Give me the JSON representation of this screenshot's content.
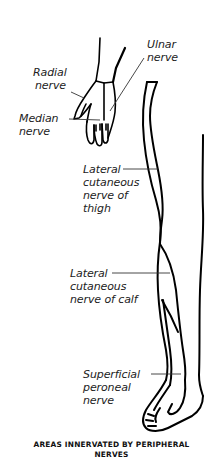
{
  "figure": {
    "title_line1": "AREAS INNERVATED BY PERIPHERAL",
    "title_line2": "NERVES",
    "labels": {
      "radial": {
        "line1": "Radial",
        "line2": "nerve"
      },
      "ulnar": {
        "line1": "Ulnar",
        "line2": "nerve"
      },
      "median": {
        "line1": "Median",
        "line2": "nerve"
      },
      "lateral_thigh": {
        "line1": "Lateral",
        "line2": "cutaneous",
        "line3": "nerve of",
        "line4": "thigh"
      },
      "lateral_calf": {
        "line1": "Lateral",
        "line2": "cutaneous",
        "line3": "nerve of calf"
      },
      "superficial_peroneal": {
        "line1": "Superficial",
        "line2": "peroneal",
        "line3": "nerve"
      }
    },
    "colors": {
      "outline": "#000000",
      "leader_line": "#333333",
      "text": "#222222"
    }
  }
}
